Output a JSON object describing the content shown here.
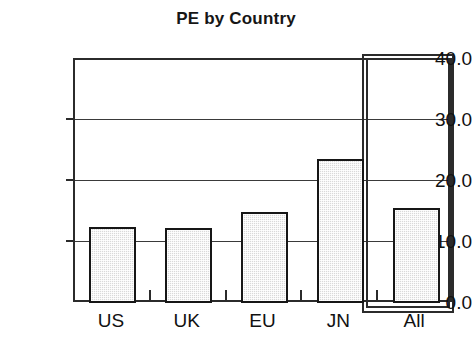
{
  "chart_data": {
    "type": "bar",
    "title": "PE by Country",
    "xlabel": "",
    "ylabel": "",
    "categories": [
      "US",
      "UK",
      "EU",
      "JN",
      "All"
    ],
    "values": [
      12.3,
      12.2,
      14.8,
      23.5,
      15.4
    ],
    "ylim": [
      0.0,
      40.0
    ],
    "ytick_labels": [
      "0.0",
      "10.0",
      "20.0",
      "30.0",
      "40.0"
    ],
    "ytick_values": [
      0.0,
      10.0,
      20.0,
      30.0,
      40.0
    ],
    "grid": true,
    "legend": false,
    "bar_fill_color": "#d9d9d9",
    "bar_edge_color": "#161616",
    "axis_color": "#2b2b2b",
    "background_color": "#ffffff",
    "highlighted_category": "All",
    "annotations": []
  },
  "axis": {
    "y_ticks": [
      {
        "label": "40.0",
        "value": 40.0
      },
      {
        "label": "30.0",
        "value": 30.0
      },
      {
        "label": "20.0",
        "value": 20.0
      },
      {
        "label": "10.0",
        "value": 10.0
      },
      {
        "label": "0.0",
        "value": 0.0
      }
    ],
    "x_ticks": [
      {
        "label": "US",
        "value": 12.3
      },
      {
        "label": "UK",
        "value": 12.2
      },
      {
        "label": "EU",
        "value": 14.8
      },
      {
        "label": "JN",
        "value": 23.5
      },
      {
        "label": "All",
        "value": 15.4
      }
    ]
  }
}
